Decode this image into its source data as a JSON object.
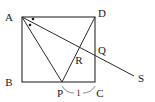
{
  "figure": {
    "background_color": "#ffffff",
    "line_color": "#2b2b2b",
    "label_color": "#1a1a1a",
    "brace_color": "#6f6f6f"
  },
  "labels": {
    "A": "A",
    "B": "B",
    "C": "C",
    "D": "D",
    "P": "P",
    "Q": "Q",
    "R": "R",
    "S": "S",
    "segment_PC_length": "1"
  },
  "points": {
    "A": {
      "x": 22,
      "y": 17,
      "label": "A",
      "label_x": 9,
      "label_y": 16
    },
    "B": {
      "x": 22,
      "y": 82,
      "label": "B",
      "label_x": 9,
      "label_y": 84
    },
    "C": {
      "x": 95,
      "y": 82,
      "label": "C",
      "label_x": 97,
      "label_y": 95
    },
    "D": {
      "x": 95,
      "y": 17,
      "label": "D",
      "label_x": 97,
      "label_y": 15
    },
    "P": {
      "x": 62,
      "y": 82,
      "label": "P",
      "label_x": 57,
      "label_y": 95
    },
    "Q": {
      "x": 95,
      "y": 50,
      "label": "Q",
      "label_x": 98,
      "label_y": 52
    },
    "R": {
      "x": 78,
      "y": 54,
      "label": "R",
      "label_x": 74,
      "label_y": 62
    },
    "S": {
      "x": 134,
      "y": 76,
      "label": "S",
      "label_x": 138,
      "label_y": 82
    }
  },
  "segments": [
    {
      "name": "square-AB",
      "from": "A",
      "to": "B"
    },
    {
      "name": "square-BC",
      "from": "B",
      "to": "C"
    },
    {
      "name": "square-CD",
      "from": "C",
      "to": "D"
    },
    {
      "name": "square-DA",
      "from": "D",
      "to": "A"
    },
    {
      "name": "cevian-AP",
      "from": "A",
      "to": "P"
    },
    {
      "name": "ray-AS",
      "from": "A",
      "to": "S"
    },
    {
      "name": "cevian-DP",
      "from": "D",
      "to": "P"
    }
  ],
  "angle_marks": {
    "at": "A",
    "dot_count": 2,
    "dots": [
      {
        "x": 33,
        "y": 19
      },
      {
        "x": 30,
        "y": 25
      }
    ]
  },
  "measure_brace": {
    "from": "P",
    "to": "C",
    "label": "1",
    "label_x": 78,
    "label_y": 95,
    "y": 92
  }
}
